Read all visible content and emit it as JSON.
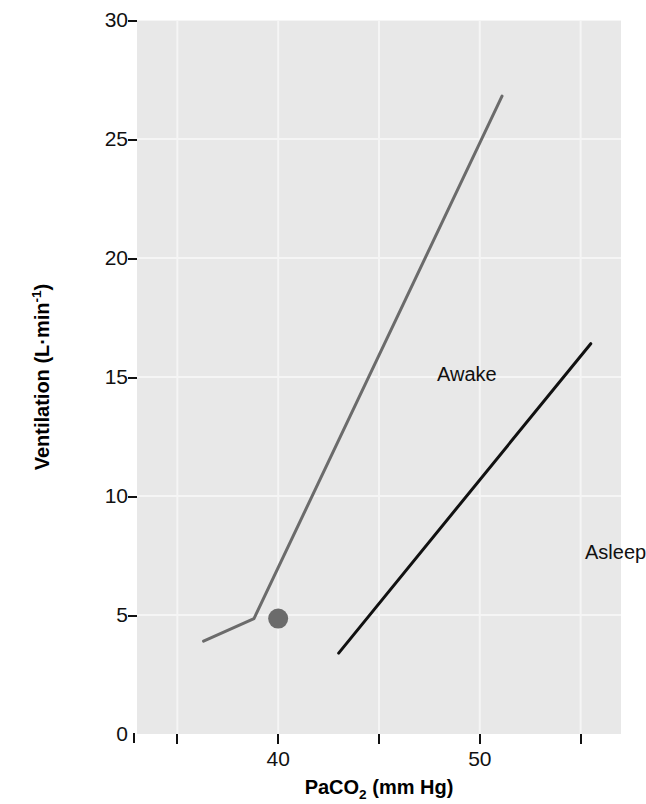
{
  "figure": {
    "background": "#ffffff",
    "plot_background": "#e8e8e8"
  },
  "axes": {
    "y": {
      "title_parts": {
        "main": "Ventilation (L",
        "middot": "·",
        "unit": "min",
        "exponent": "-1",
        "close": ")"
      },
      "title_plain": "Ventilation (L·min⁻¹)",
      "ticks": [
        {
          "value": 30,
          "label": "30"
        },
        {
          "value": 25,
          "label": "25"
        },
        {
          "value": 20,
          "label": "20"
        },
        {
          "value": 15,
          "label": "15"
        },
        {
          "value": 10,
          "label": "10"
        },
        {
          "value": 5,
          "label": "5"
        },
        {
          "value": 0,
          "label": "0"
        }
      ]
    },
    "x": {
      "title_parts": {
        "pre": "PaCO",
        "sub": "2",
        "post": " (mm Hg)"
      },
      "title_plain": "PaCO₂ (mm Hg)",
      "ticks": [
        {
          "value": 35,
          "label": ""
        },
        {
          "value": 40,
          "label": "40"
        },
        {
          "value": 45,
          "label": ""
        },
        {
          "value": 50,
          "label": "50"
        },
        {
          "value": 55,
          "label": ""
        }
      ]
    }
  },
  "annotations": [
    {
      "name": "awake-label",
      "text": "Awake"
    },
    {
      "name": "asleep-label",
      "text": "Asleep"
    }
  ],
  "chart_data": {
    "type": "line",
    "title": "",
    "xlabel": "PaCO2 (mm Hg)",
    "ylabel": "Ventilation (L·min⁻¹)",
    "xlim": [
      33,
      57
    ],
    "ylim": [
      0,
      30
    ],
    "xticks": [
      35,
      40,
      45,
      50,
      55
    ],
    "xticklabels": [
      "",
      "40",
      "",
      "50",
      ""
    ],
    "yticks": [
      0,
      5,
      10,
      15,
      20,
      25,
      30
    ],
    "yticklabels": [
      "30",
      "25",
      "20",
      "15",
      "10",
      "5",
      "0"
    ],
    "grid": true,
    "grid_color": "#f5f5f5",
    "legend": "inline-annotations",
    "series": [
      {
        "name": "Awake",
        "color": "#6b6b6b",
        "linewidth": 3,
        "label_position": {
          "x": 41.4,
          "y": 15.9
        },
        "points": [
          {
            "x": 36.3,
            "y": 3.9
          },
          {
            "x": 38.8,
            "y": 4.85
          },
          {
            "x": 51.1,
            "y": 26.8
          }
        ],
        "marker": {
          "name": "resting-point",
          "x": 40.0,
          "y": 4.85,
          "shape": "circle",
          "radius": 10,
          "color": "#6b6b6b"
        }
      },
      {
        "name": "Asleep",
        "color": "#111111",
        "linewidth": 3,
        "label_position": {
          "x": 48.8,
          "y": 8.9
        },
        "points": [
          {
            "x": 43.0,
            "y": 3.4
          },
          {
            "x": 55.5,
            "y": 16.4
          }
        ]
      }
    ]
  }
}
